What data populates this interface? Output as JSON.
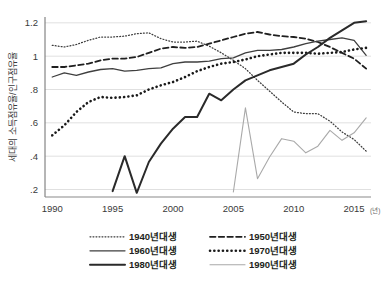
{
  "chart_data": {
    "type": "line",
    "title": "",
    "xlabel": "",
    "ylabel": "세대의 소득점유율/인구점유율",
    "x_unit": "(년)",
    "xlim": [
      1989.4,
      2016.4
    ],
    "ylim": [
      0.155,
      1.235
    ],
    "xticks": [
      1990,
      1995,
      2000,
      2005,
      2010,
      2015
    ],
    "xtick_labels": [
      "1990",
      "1995",
      "2000",
      "2005",
      "2010",
      "2015"
    ],
    "yticks": [
      0.2,
      0.4,
      0.6,
      0.8,
      1.0,
      1.2
    ],
    "ytick_labels": [
      ".2",
      ".4",
      ".6",
      ".8",
      "1",
      "1.2"
    ],
    "grid": true,
    "legend_position": "bottom",
    "series": [
      {
        "name": "1940년대생",
        "style": "fine-dotted",
        "color": "#3c3c3c",
        "width": 1.25,
        "dash": "0.9 2.1",
        "x": [
          1990,
          1991,
          1992,
          1993,
          1994,
          1995,
          1996,
          1997,
          1998,
          1999,
          2000,
          2001,
          2002,
          2003,
          2004,
          2005,
          2006,
          2007,
          2008,
          2009,
          2010,
          2011,
          2012,
          2013,
          2014,
          2015,
          2016
        ],
        "values": [
          1.065,
          1.055,
          1.07,
          1.095,
          1.115,
          1.115,
          1.12,
          1.135,
          1.14,
          1.105,
          1.085,
          1.085,
          1.09,
          1.06,
          1.02,
          0.975,
          0.925,
          0.855,
          0.79,
          0.725,
          0.665,
          0.655,
          0.655,
          0.61,
          0.545,
          0.5,
          0.43
        ]
      },
      {
        "name": "1950년대생",
        "style": "dashed",
        "color": "#1f1f1f",
        "width": 1.8,
        "dash": "5.5 3.2",
        "x": [
          1990,
          1991,
          1992,
          1993,
          1994,
          1995,
          1996,
          1997,
          1998,
          1999,
          2000,
          2001,
          2002,
          2003,
          2004,
          2005,
          2006,
          2007,
          2008,
          2009,
          2010,
          2011,
          2012,
          2013,
          2014,
          2015,
          2016
        ],
        "values": [
          0.935,
          0.935,
          0.945,
          0.955,
          0.975,
          0.985,
          0.985,
          0.995,
          1.02,
          1.045,
          1.055,
          1.05,
          1.055,
          1.075,
          1.095,
          1.115,
          1.135,
          1.145,
          1.13,
          1.12,
          1.115,
          1.105,
          1.085,
          1.055,
          1.02,
          0.985,
          0.925
        ]
      },
      {
        "name": "1960년대생",
        "style": "thin-solid",
        "color": "#3f3f3f",
        "width": 1.3,
        "dash": "",
        "x": [
          1990,
          1991,
          1992,
          1993,
          1994,
          1995,
          1996,
          1997,
          1998,
          1999,
          2000,
          2001,
          2002,
          2003,
          2004,
          2005,
          2006,
          2007,
          2008,
          2009,
          2010,
          2011,
          2012,
          2013,
          2014,
          2015,
          2016
        ],
        "values": [
          0.875,
          0.9,
          0.885,
          0.905,
          0.92,
          0.925,
          0.91,
          0.915,
          0.925,
          0.93,
          0.955,
          0.965,
          0.965,
          0.97,
          0.985,
          0.99,
          1.02,
          1.035,
          1.035,
          1.04,
          1.055,
          1.075,
          1.09,
          1.1,
          1.11,
          1.095,
          1.005
        ]
      },
      {
        "name": "1970년대생",
        "style": "thick-dotted",
        "color": "#1a1a1a",
        "width": 2.6,
        "dash": "0.1 4.2",
        "x": [
          1990,
          1991,
          1992,
          1993,
          1994,
          1995,
          1996,
          1997,
          1998,
          1999,
          2000,
          2001,
          2002,
          2003,
          2004,
          2005,
          2006,
          2007,
          2008,
          2009,
          2010,
          2011,
          2012,
          2013,
          2014,
          2015,
          2016
        ],
        "values": [
          0.525,
          0.585,
          0.665,
          0.725,
          0.755,
          0.75,
          0.755,
          0.765,
          0.8,
          0.825,
          0.845,
          0.875,
          0.91,
          0.935,
          0.955,
          0.965,
          0.98,
          1.0,
          1.01,
          1.02,
          1.02,
          1.02,
          1.015,
          1.02,
          1.025,
          1.04,
          1.05
        ]
      },
      {
        "name": "1980년대생",
        "style": "thick-solid",
        "color": "#2a2a2a",
        "width": 2.0,
        "dash": "",
        "x": [
          1995,
          1996,
          1997,
          1998,
          1999,
          2000,
          2001,
          2002,
          2003,
          2004,
          2005,
          2006,
          2007,
          2008,
          2009,
          2010,
          2011,
          2012,
          2013,
          2014,
          2015,
          2016
        ],
        "values": [
          0.19,
          0.4,
          0.18,
          0.365,
          0.475,
          0.565,
          0.635,
          0.635,
          0.775,
          0.735,
          0.8,
          0.855,
          0.885,
          0.915,
          0.935,
          0.955,
          1.01,
          1.055,
          1.11,
          1.155,
          1.2,
          1.21
        ]
      },
      {
        "name": "1990년대생",
        "style": "light-solid",
        "color": "#a9a9a9",
        "width": 1.1,
        "dash": "",
        "x": [
          2005,
          2006,
          2007,
          2008,
          2009,
          2010,
          2011,
          2012,
          2013,
          2014,
          2015,
          2016
        ],
        "values": [
          0.185,
          0.69,
          0.265,
          0.395,
          0.505,
          0.49,
          0.42,
          0.46,
          0.555,
          0.495,
          0.54,
          0.63
        ]
      }
    ],
    "legend": [
      {
        "label": "1940년대생",
        "style": "fine-dotted",
        "color": "#3c3c3c"
      },
      {
        "label": "1950년대생",
        "style": "dashed",
        "color": "#1f1f1f"
      },
      {
        "label": "1960년대생",
        "style": "thin-solid",
        "color": "#3f3f3f"
      },
      {
        "label": "1970년대생",
        "style": "thick-dotted",
        "color": "#1a1a1a"
      },
      {
        "label": "1980년대생",
        "style": "thick-solid",
        "color": "#2a2a2a"
      },
      {
        "label": "1990년대생",
        "style": "light-solid",
        "color": "#a9a9a9"
      }
    ]
  }
}
